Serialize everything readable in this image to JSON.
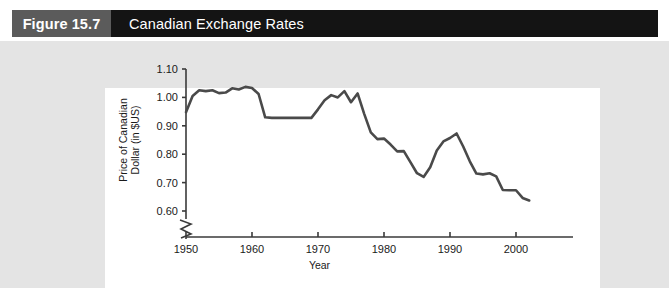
{
  "header": {
    "figure_tag": "Figure 15.7",
    "title": "Canadian Exchange Rates",
    "tag_bg": "#5b5b5b",
    "bar_bg": "#141414",
    "text_color": "#ffffff"
  },
  "page": {
    "background": "#e4e4e4",
    "panel_background": "#ffffff"
  },
  "chart_data": {
    "type": "line",
    "title": "Canadian Exchange Rates",
    "xlabel": "Year",
    "ylabel": "Price of Canadian Dollar (in $US)",
    "ylabel_line1": "Price of Canadian",
    "ylabel_line2": "Dollar (in $US)",
    "xlim": [
      1950,
      2003
    ],
    "ylim": [
      0.58,
      1.1
    ],
    "yticks": [
      0.6,
      0.7,
      0.8,
      0.9,
      1.0,
      1.1
    ],
    "ytick_labels": [
      "0.60",
      "0.70",
      "0.80",
      "0.90",
      "1.00",
      "1.10"
    ],
    "xticks": [
      1950,
      1960,
      1970,
      1980,
      1990,
      2000
    ],
    "xtick_labels": [
      "1950",
      "1960",
      "1970",
      "1980",
      "1990",
      "2000"
    ],
    "axis_break": true,
    "axis_break_note": "zigzag break on y-axis below 0.60",
    "grid": false,
    "legend": false,
    "line_color": "#4a4a4a",
    "series": [
      {
        "name": "Price of Canadian Dollar (in $US)",
        "x": [
          1950,
          1951,
          1952,
          1953,
          1954,
          1955,
          1956,
          1957,
          1958,
          1959,
          1960,
          1961,
          1962,
          1963,
          1964,
          1965,
          1966,
          1967,
          1968,
          1969,
          1970,
          1971,
          1972,
          1973,
          1974,
          1975,
          1976,
          1977,
          1978,
          1979,
          1980,
          1981,
          1982,
          1983,
          1984,
          1985,
          1986,
          1987,
          1988,
          1989,
          1990,
          1991,
          1992,
          1993,
          1994,
          1995,
          1996,
          1997,
          1998,
          1999,
          2000,
          2001,
          2002
        ],
        "values": [
          0.948,
          1.005,
          1.025,
          1.022,
          1.025,
          1.015,
          1.017,
          1.032,
          1.028,
          1.037,
          1.033,
          1.012,
          0.93,
          0.928,
          0.928,
          0.928,
          0.928,
          0.928,
          0.928,
          0.928,
          0.958,
          0.99,
          1.008,
          1.0,
          1.022,
          0.983,
          1.014,
          0.942,
          0.877,
          0.853,
          0.855,
          0.834,
          0.81,
          0.811,
          0.772,
          0.733,
          0.72,
          0.754,
          0.813,
          0.845,
          0.857,
          0.873,
          0.827,
          0.775,
          0.732,
          0.729,
          0.733,
          0.722,
          0.674,
          0.673,
          0.673,
          0.646,
          0.637
        ]
      }
    ]
  }
}
